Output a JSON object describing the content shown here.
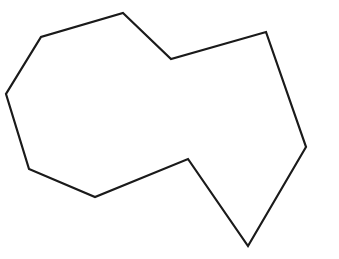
{
  "canvas": {
    "width": 339,
    "height": 259,
    "background_color": "#ffffff"
  },
  "figure": {
    "name": "irregular-polygon",
    "shape_type": "closed polygon outline",
    "vertex_count": 10,
    "stroke_color": "#1a1a1a",
    "stroke_width": 2.2,
    "fill_color": "none",
    "points": "123,13 171,59 266,32 306,147 248,246 188,159 95,197 29,169 6,94 41,37",
    "vertices": [
      {
        "label": "top-peak",
        "x": 123,
        "y": 13
      },
      {
        "label": "upper-notch-bottom",
        "x": 171,
        "y": 59
      },
      {
        "label": "top-right-corner",
        "x": 266,
        "y": 32
      },
      {
        "label": "right-corner",
        "x": 306,
        "y": 147
      },
      {
        "label": "bottom-point",
        "x": 248,
        "y": 246
      },
      {
        "label": "inner-notch-peak",
        "x": 188,
        "y": 159
      },
      {
        "label": "bottom-left-corner",
        "x": 95,
        "y": 197
      },
      {
        "label": "lower-left-corner",
        "x": 29,
        "y": 169
      },
      {
        "label": "leftmost-corner",
        "x": 6,
        "y": 94
      },
      {
        "label": "upper-left-shoulder",
        "x": 41,
        "y": 37
      }
    ]
  }
}
